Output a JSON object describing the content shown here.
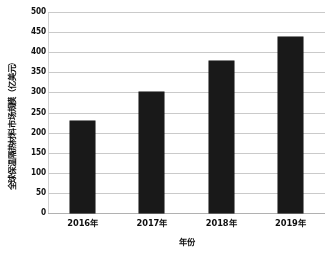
{
  "chart_data": {
    "type": "bar",
    "title": "",
    "categories": [
      "2016年",
      "2017年",
      "2018年",
      "2019年"
    ],
    "values": [
      230,
      300,
      378,
      438
    ],
    "xlabel": "年份",
    "ylabel": "全球保温隔热材料市场规模（亿美元）",
    "ylim": [
      0,
      500
    ],
    "ytick_step": 50,
    "yticks": [
      "500",
      "450",
      "400",
      "350",
      "300",
      "250",
      "200",
      "150",
      "100",
      "50",
      "0"
    ],
    "grid": true,
    "legend": "none",
    "bar_color": "#1b1b1b",
    "gridline_color": "#c9c9c9",
    "background_color": "#ffffff"
  }
}
